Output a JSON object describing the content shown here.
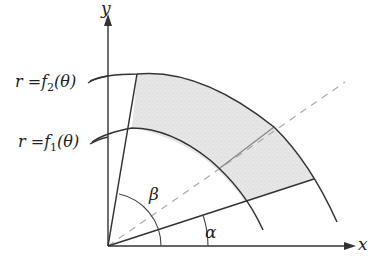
{
  "diagram": {
    "title": "",
    "axes": {
      "x_label": "x",
      "y_label": "y"
    },
    "curves": [
      {
        "name": "outer",
        "label_r": "r",
        "label_eq": "=",
        "label_f": "f",
        "label_sub": "2",
        "label_arg": "(θ)"
      },
      {
        "name": "inner",
        "label_r": "r",
        "label_eq": "=",
        "label_f": "f",
        "label_sub": "1",
        "label_arg": "(θ)"
      }
    ],
    "angles": {
      "alpha": "α",
      "beta": "β"
    },
    "colors": {
      "line": "#333333",
      "region_fill": "#e3e3e3",
      "dash": "#aaaaaa",
      "ray": "#888888"
    }
  }
}
